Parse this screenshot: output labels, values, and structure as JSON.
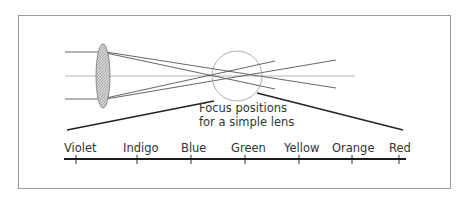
{
  "diagram": {
    "caption": {
      "line1": "Focus positions",
      "line2": "for a simple lens"
    },
    "spectrum": {
      "labels": [
        "Violet",
        "Indigo",
        "Blue",
        "Green",
        "Yellow",
        "Orange",
        "Red"
      ]
    },
    "colors": {
      "frame": "#9a9a9a",
      "lens_fill": "#bdbdbd",
      "ray": "#444444",
      "axis": "#a8a8a8",
      "text": "#333333"
    }
  }
}
